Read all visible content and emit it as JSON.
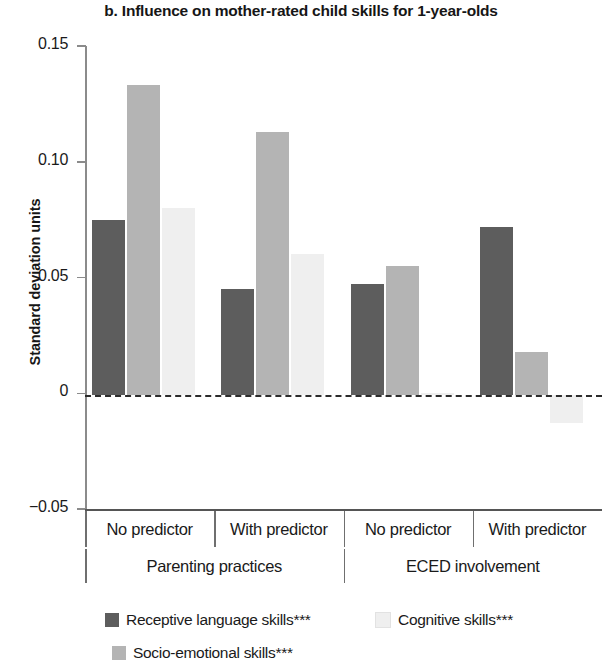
{
  "title": "b. Influence on mother-rated child skills for 1-year-olds",
  "y_axis": {
    "label": "Standard deviation units",
    "ticks": [
      "0.15",
      "0.10",
      "0.05",
      "0",
      "−0.05"
    ]
  },
  "x_axis": {
    "categories": [
      "No predictor",
      "With predictor",
      "No predictor",
      "With predictor"
    ],
    "groups": [
      "Parenting practices",
      "ECED involvement"
    ]
  },
  "legend": [
    {
      "label": "Receptive language skills***",
      "color": "#5d5d5d"
    },
    {
      "label": "Cognitive skills***",
      "color": "#efefef"
    },
    {
      "label": "Socio-emotional skills***",
      "color": "#b4b4b4"
    }
  ],
  "colors": {
    "receptive": "#5d5d5d",
    "socio": "#b4b4b4",
    "cognitive": "#efefef",
    "axis": "#8b8b8b",
    "zero_line": "#2b2b2b",
    "text": "#1a1a1a"
  },
  "chart_data": {
    "type": "bar",
    "title": "b. Influence on mother-rated child skills for 1-year-olds",
    "xlabel": "",
    "ylabel": "Standard deviation units",
    "ylim": [
      -0.05,
      0.15
    ],
    "yticks": [
      0.15,
      0.1,
      0.05,
      0,
      -0.05
    ],
    "grid": false,
    "legend_position": "bottom",
    "categories": [
      "No predictor",
      "With predictor",
      "No predictor",
      "With predictor"
    ],
    "group_labels": [
      "Parenting practices",
      "ECED involvement"
    ],
    "group_spans": [
      [
        0,
        1
      ],
      [
        2,
        3
      ]
    ],
    "series": [
      {
        "name": "Receptive language skills***",
        "color": "#5d5d5d",
        "values": [
          0.075,
          0.045,
          0.047,
          0.072
        ]
      },
      {
        "name": "Socio-emotional skills***",
        "color": "#b4b4b4",
        "values": [
          0.133,
          0.113,
          0.055,
          0.018
        ]
      },
      {
        "name": "Cognitive skills***",
        "color": "#efefef",
        "values": [
          0.08,
          0.06,
          0.0,
          -0.013
        ]
      }
    ],
    "series_order_in_plot": [
      "Receptive language skills***",
      "Socio-emotional skills***",
      "Cognitive skills***"
    ]
  }
}
